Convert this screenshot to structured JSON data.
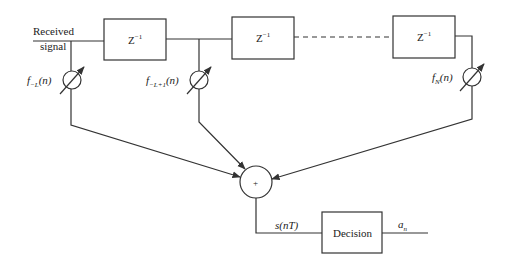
{
  "diagram": {
    "input_label_line1": "Received",
    "input_label_line2": "signal",
    "delays": [
      {
        "label": "Z",
        "exp": "−1"
      },
      {
        "label": "Z",
        "exp": "−1"
      },
      {
        "label": "Z",
        "exp": "−1"
      }
    ],
    "taps": [
      {
        "f": "f",
        "sub": "−L",
        "arg": "(n)"
      },
      {
        "f": "f",
        "sub": "−L+1",
        "arg": "(n)"
      },
      {
        "f": "f",
        "sub": "N",
        "arg": "(n)"
      }
    ],
    "summer_symbol": "+",
    "sum_output_label": "s(nT)",
    "decision_label": "Decision",
    "output_label": "a",
    "output_sub": "n",
    "colors": {
      "stroke": "#333333",
      "background": "#ffffff"
    }
  }
}
